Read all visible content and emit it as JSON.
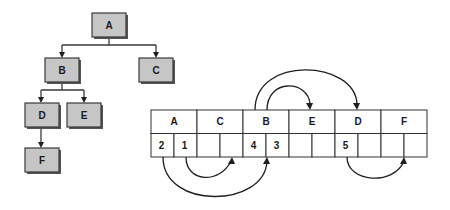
{
  "tree": {
    "nodes": [
      {
        "id": "A",
        "label": "A"
      },
      {
        "id": "B",
        "label": "B"
      },
      {
        "id": "C",
        "label": "C"
      },
      {
        "id": "D",
        "label": "D"
      },
      {
        "id": "E",
        "label": "E"
      },
      {
        "id": "F",
        "label": "F"
      }
    ],
    "edges": [
      {
        "from": "A",
        "to": "B"
      },
      {
        "from": "A",
        "to": "C"
      },
      {
        "from": "B",
        "to": "D"
      },
      {
        "from": "B",
        "to": "E"
      },
      {
        "from": "D",
        "to": "F"
      }
    ]
  },
  "array": {
    "labels": [
      "A",
      "C",
      "B",
      "E",
      "D",
      "F"
    ],
    "child_slots": [
      [
        "2",
        "1"
      ],
      [
        "",
        ""
      ],
      [
        "4",
        "3"
      ],
      [
        "",
        ""
      ],
      [
        "5",
        ""
      ],
      [
        "",
        ""
      ]
    ],
    "links": [
      {
        "from": "slot 1 of A",
        "to": "C"
      },
      {
        "from": "slot 2 of A",
        "to": "B"
      },
      {
        "from": "slot 3 of B",
        "to": "E"
      },
      {
        "from": "slot 4 of B",
        "to": "D"
      },
      {
        "from": "slot 5 of D",
        "to": "F"
      }
    ]
  }
}
